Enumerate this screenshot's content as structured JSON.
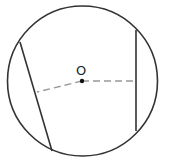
{
  "diagram": {
    "type": "geometry",
    "center_label": "O",
    "colors": {
      "stroke": "#333333",
      "dashed": "#999999",
      "center_dot": "#111111",
      "background": "#ffffff"
    },
    "circle": {
      "cx": 82.5,
      "cy": 81,
      "r": 75
    },
    "center_point": {
      "x": 82,
      "y": 81
    },
    "chords": [
      {
        "name": "left-chord",
        "x1": 20,
        "y1": 42,
        "x2": 52,
        "y2": 151
      },
      {
        "name": "right-chord",
        "x1": 136,
        "y1": 30,
        "x2": 136,
        "y2": 131
      }
    ],
    "distances": [
      {
        "name": "distance-to-left-chord",
        "x1": 82,
        "y1": 81,
        "x2": 37,
        "y2": 92
      },
      {
        "name": "distance-to-right-chord",
        "x1": 82,
        "y1": 81,
        "x2": 136,
        "y2": 81
      }
    ]
  }
}
